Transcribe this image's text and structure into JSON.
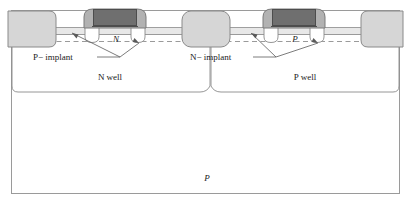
{
  "figure": {
    "type": "cmos-cross-section",
    "title_visible": false,
    "labels": {
      "n_channel": "N",
      "p_channel": "P",
      "p_minus_implant": "P− implant",
      "n_minus_implant": "N− implant",
      "n_well": "N well",
      "p_well": "P well",
      "substrate": "P"
    },
    "colors": {
      "outline": "#8a8a8a",
      "contact_fill": "#d4d4d4",
      "spacer_fill": "#b0b0b0",
      "gate_fill": "#6e6e6e",
      "layer_fill": "#e3e3e3",
      "substrate_fill": "#ffffff",
      "text": "#1a1a1a",
      "dashed": "#9a9a9a"
    },
    "regions": [
      {
        "name": "n-well",
        "label": "N well"
      },
      {
        "name": "p-well",
        "label": "P well"
      },
      {
        "name": "p-substrate",
        "label": "P"
      }
    ],
    "devices": [
      {
        "name": "nmos-gate",
        "channel_label": "N",
        "implant_label": "P− implant"
      },
      {
        "name": "pmos-gate",
        "channel_label": "P",
        "implant_label": "N− implant"
      }
    ],
    "contacts": [
      {
        "name": "contact-left",
        "clipped": true
      },
      {
        "name": "contact-center",
        "clipped": false
      },
      {
        "name": "contact-right",
        "clipped": true
      }
    ]
  }
}
